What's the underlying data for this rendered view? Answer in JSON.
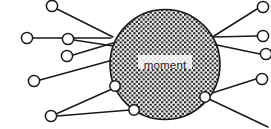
{
  "figure": {
    "type": "radial-node-diagram",
    "center_label": "moment",
    "background_color": "#ffffff",
    "stroke_color": "#1a1a1a",
    "node_fill": "#ffffff"
  },
  "hub": {
    "name": "moment",
    "cx": 165,
    "cy": 64.5,
    "r": 55,
    "fill_pattern": "stipple",
    "pattern_dot_color": "#1d1d1d",
    "pattern_dot_spacing": 4.6,
    "pattern_dot_radius": 1.25
  },
  "rim_nodes": [
    {
      "id": "rim-left-lower",
      "cx": 115,
      "cy": 86,
      "r": 5.2
    },
    {
      "id": "rim-bottom",
      "cx": 134,
      "cy": 110,
      "r": 5.2
    },
    {
      "id": "rim-right-lower",
      "cx": 205,
      "cy": 97,
      "r": 5.2
    }
  ],
  "outer_nodes": [
    {
      "id": "node-top-left",
      "cx": 52,
      "cy": 6,
      "r": 5.6
    },
    {
      "id": "node-left-upper",
      "cx": 27,
      "cy": 38,
      "r": 5.6
    },
    {
      "id": "node-left-inner-upper",
      "cx": 68,
      "cy": 39,
      "r": 5.6
    },
    {
      "id": "node-left-inner-lower",
      "cx": 67,
      "cy": 56,
      "r": 5.6
    },
    {
      "id": "node-left-lower",
      "cx": 34,
      "cy": 81,
      "r": 5.6
    },
    {
      "id": "node-bottom-left",
      "cx": 51,
      "cy": 116,
      "r": 5.6
    },
    {
      "id": "node-right-top",
      "cx": 263,
      "cy": 7,
      "r": 5.6
    },
    {
      "id": "node-right-upper",
      "cx": 263,
      "cy": 36,
      "r": 5.6
    },
    {
      "id": "node-right-mid",
      "cx": 266,
      "cy": 54,
      "r": 5.6
    },
    {
      "id": "node-right-lower",
      "cx": 262,
      "cy": 79,
      "r": 5.6
    }
  ],
  "edges": [
    {
      "id": "edge-top-left",
      "x1": 57,
      "y1": 9,
      "x2": 113,
      "y2": 37
    },
    {
      "id": "edge-left-upper",
      "x1": 33,
      "y1": 38,
      "x2": 111,
      "y2": 38
    },
    {
      "id": "edge-left-inner-upper",
      "x1": 74,
      "y1": 40,
      "x2": 113,
      "y2": 46
    },
    {
      "id": "edge-left-inner-lower",
      "x1": 73,
      "y1": 55,
      "x2": 113,
      "y2": 43
    },
    {
      "id": "edge-left-lower",
      "x1": 40,
      "y1": 80,
      "x2": 113,
      "y2": 60
    },
    {
      "id": "edge-bottom-left-to-rim-left",
      "x1": 56,
      "y1": 114,
      "x2": 112,
      "y2": 89
    },
    {
      "id": "edge-bottom-left-to-rim-bottom",
      "x1": 57,
      "y1": 116,
      "x2": 130,
      "y2": 110
    },
    {
      "id": "edge-rim-left-to-rim-bottom",
      "x1": 117,
      "y1": 90,
      "x2": 131,
      "y2": 107
    },
    {
      "id": "edge-right-top",
      "x1": 257,
      "y1": 9,
      "x2": 214,
      "y2": 36
    },
    {
      "id": "edge-right-upper",
      "x1": 257,
      "y1": 36,
      "x2": 213,
      "y2": 37
    },
    {
      "id": "edge-right-mid",
      "x1": 260,
      "y1": 54,
      "x2": 212,
      "y2": 44
    },
    {
      "id": "edge-right-lower",
      "x1": 256,
      "y1": 79,
      "x2": 209,
      "y2": 94
    },
    {
      "id": "edge-rim-right-out",
      "x1": 209,
      "y1": 99,
      "x2": 268,
      "y2": 127
    },
    {
      "id": "edge-rim-right-to-circle",
      "x1": 203,
      "y1": 93,
      "x2": 213,
      "y2": 72
    }
  ]
}
